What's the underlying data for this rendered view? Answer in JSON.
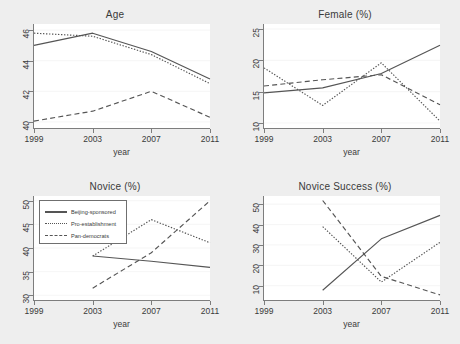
{
  "figure": {
    "background_color": "#eeeeee",
    "plot_background_color": "#ffffff",
    "line_color": "#555555",
    "axis_color": "#7d7d7d",
    "grid_color": "#f0f0f0"
  },
  "legend": {
    "entries": [
      {
        "label": "Beijing-sponsored",
        "style": "solid"
      },
      {
        "label": "Pro-establishment",
        "style": "dotted"
      },
      {
        "label": "Pan-democrats",
        "style": "dashed"
      }
    ]
  },
  "chart_data": [
    {
      "type": "line",
      "title": "Age",
      "xlabel": "year",
      "ylabel": "",
      "x": [
        1999,
        2003,
        2007,
        2011
      ],
      "xticklabels": [
        "1999",
        "2003",
        "2007",
        "2011"
      ],
      "xlim": [
        1999,
        2011
      ],
      "ylim": [
        39.6,
        46.4
      ],
      "yticks": [
        40,
        42,
        44,
        46
      ],
      "yticklabels": [
        "40",
        "42",
        "44",
        "46"
      ],
      "grid": true,
      "legend_position": "none",
      "series": [
        {
          "name": "Beijing-sponsored",
          "style": "solid",
          "values": [
            45.0,
            45.8,
            44.6,
            42.8
          ]
        },
        {
          "name": "Pro-establishment",
          "style": "dotted",
          "values": [
            45.8,
            45.6,
            44.4,
            42.5
          ]
        },
        {
          "name": "Pan-democrats",
          "style": "dashed",
          "values": [
            40.05,
            40.7,
            42.0,
            40.3
          ]
        }
      ]
    },
    {
      "type": "line",
      "title": "Female (%)",
      "xlabel": "year",
      "ylabel": "",
      "x": [
        1999,
        2003,
        2007,
        2011
      ],
      "xticklabels": [
        "1999",
        "2003",
        "2007",
        "2011"
      ],
      "xlim": [
        1999,
        2011
      ],
      "ylim": [
        9.2,
        25.8
      ],
      "yticks": [
        10,
        15,
        20,
        25
      ],
      "yticklabels": [
        "10",
        "15",
        "20",
        "25"
      ],
      "grid": true,
      "legend_position": "none",
      "series": [
        {
          "name": "Beijing-sponsored",
          "style": "solid",
          "values": [
            14.8,
            15.6,
            17.9,
            22.4
          ]
        },
        {
          "name": "Pro-establishment",
          "style": "dotted",
          "values": [
            18.8,
            12.8,
            19.6,
            10.3
          ]
        },
        {
          "name": "Pan-democrats",
          "style": "dashed",
          "values": [
            15.9,
            16.9,
            17.7,
            12.9
          ]
        }
      ]
    },
    {
      "type": "line",
      "title": "Novice (%)",
      "xlabel": "year",
      "ylabel": "",
      "x": [
        2003,
        2007,
        2011
      ],
      "xticklabels": [
        "1999",
        "2003",
        "2007",
        "2011"
      ],
      "xlim": [
        1999,
        2011
      ],
      "ylim": [
        29.0,
        51.0
      ],
      "yticks": [
        30,
        35,
        40,
        45,
        50
      ],
      "yticklabels": [
        "30",
        "35",
        "40",
        "45",
        "50"
      ],
      "grid": true,
      "legend_position": "upper-left",
      "series": [
        {
          "name": "Beijing-sponsored",
          "style": "solid",
          "values": [
            38.3,
            37.2,
            35.9
          ]
        },
        {
          "name": "Pro-establishment",
          "style": "dotted",
          "values": [
            38.3,
            46.0,
            41.1
          ]
        },
        {
          "name": "Pan-democrats",
          "style": "dashed",
          "values": [
            31.5,
            39.0,
            50.0
          ]
        }
      ]
    },
    {
      "type": "line",
      "title": "Novice Success (%)",
      "xlabel": "year",
      "ylabel": "",
      "x": [
        2003,
        2007,
        2011
      ],
      "xticklabels": [
        "1999",
        "2003",
        "2007",
        "2011"
      ],
      "xlim": [
        1999,
        2011
      ],
      "ylim": [
        3.0,
        54.0
      ],
      "yticks": [
        10,
        20,
        30,
        40,
        50
      ],
      "yticklabels": [
        "10",
        "20",
        "30",
        "40",
        "50"
      ],
      "grid": true,
      "legend_position": "none",
      "series": [
        {
          "name": "Beijing-sponsored",
          "style": "solid",
          "values": [
            7.8,
            33.0,
            44.5
          ]
        },
        {
          "name": "Pro-establishment",
          "style": "dotted",
          "values": [
            39.0,
            11.8,
            31.3
          ]
        },
        {
          "name": "Pan-democrats",
          "style": "dashed",
          "values": [
            51.8,
            14.6,
            5.5
          ]
        }
      ]
    }
  ]
}
